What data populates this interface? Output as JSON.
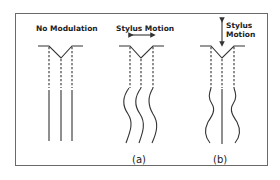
{
  "figure": {
    "panels": [
      {
        "id": "no-modulation",
        "label": "No Modulation",
        "caption": ""
      },
      {
        "id": "lateral",
        "label": "Stylus Motion",
        "caption": "(a)",
        "arrow": "horizontal"
      },
      {
        "id": "vertical",
        "label_line1": "Stylus",
        "label_line2": "Motion",
        "caption": "(b)",
        "arrow": "vertical"
      }
    ]
  },
  "colors": {
    "ink": "#333333",
    "border": "#6a6a6a",
    "background": "#ffffff"
  }
}
